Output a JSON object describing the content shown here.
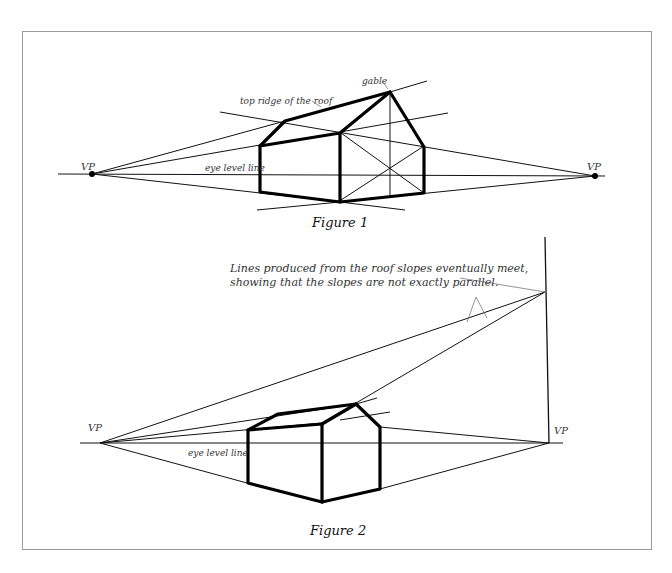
{
  "figure1": {
    "caption": "Figure 1",
    "labels": {
      "vp_left": "VP",
      "vp_right": "VP",
      "eye_level": "eye level line",
      "top_ridge": "top ridge of the roof",
      "gable": "gable"
    }
  },
  "figure2": {
    "caption": "Figure 2",
    "labels": {
      "vp_left": "VP",
      "vp_right": "VP",
      "eye_level": "eye level line",
      "annotation_line1": "Lines produced from the roof slopes eventually meet,",
      "annotation_line2": "showing that the slopes are not exactly parallel."
    }
  },
  "colors": {
    "line": "#000000",
    "frame": "#9a9a9a",
    "label": "#333333"
  }
}
